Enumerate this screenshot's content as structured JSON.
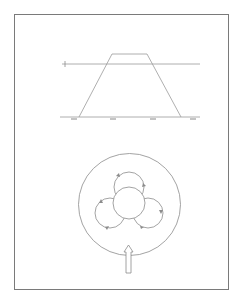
{
  "figure": {
    "frame": {
      "stroke": "#7a7a7a"
    },
    "top_panel": {
      "description": "trapezoidal profile above baseline with horizontal threshold line",
      "threshold_label": "",
      "tick_labels": [
        "",
        "",
        "",
        ""
      ],
      "line_color": "#9a9a9a"
    },
    "bottom_panel": {
      "description": "outer circle enclosing three looping lobes around a central circle, with upward arrow entering from below",
      "lobes": 3,
      "line_color": "#8c8c8c"
    }
  }
}
